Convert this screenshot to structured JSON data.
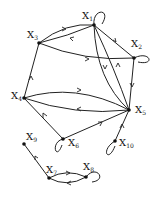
{
  "diagram": {
    "type": "directed-graph",
    "nodes": [
      {
        "id": "x1",
        "label": "X",
        "sub": "1",
        "x": 94,
        "y": 25,
        "lx": 82,
        "ly": 19
      },
      {
        "id": "x2",
        "label": "X",
        "sub": "2",
        "x": 134,
        "y": 58,
        "lx": 131,
        "ly": 47
      },
      {
        "id": "x3",
        "label": "X",
        "sub": "3",
        "x": 39,
        "y": 43,
        "lx": 27,
        "ly": 38
      },
      {
        "id": "x4",
        "label": "X",
        "sub": "4",
        "x": 24,
        "y": 98,
        "lx": 11,
        "ly": 99
      },
      {
        "id": "x5",
        "label": "X",
        "sub": "5",
        "x": 129,
        "y": 110,
        "lx": 135,
        "ly": 113
      },
      {
        "id": "x6",
        "label": "X",
        "sub": "6",
        "x": 63,
        "y": 139,
        "lx": 68,
        "ly": 146
      },
      {
        "id": "x7",
        "label": "X",
        "sub": "7",
        "x": 49,
        "y": 178,
        "lx": 46,
        "ly": 173
      },
      {
        "id": "x8",
        "label": "X",
        "sub": "8",
        "x": 86,
        "y": 177,
        "lx": 83,
        "ly": 170
      },
      {
        "id": "x9",
        "label": "X",
        "sub": "9",
        "x": 24,
        "y": 144,
        "lx": 26,
        "ly": 140
      },
      {
        "id": "x10",
        "label": "X",
        "sub": "10",
        "x": 115,
        "y": 141,
        "lx": 119,
        "ly": 146
      }
    ],
    "edges": [
      {
        "from": "x3",
        "to": "x1",
        "curve": "upper"
      },
      {
        "from": "x1",
        "to": "x3",
        "curve": "lower"
      },
      {
        "from": "x1",
        "to": "x2"
      },
      {
        "from": "x3",
        "to": "x2"
      },
      {
        "from": "x1",
        "to": "x5",
        "curve": "left"
      },
      {
        "from": "x5",
        "to": "x1",
        "curve": "right"
      },
      {
        "from": "x2",
        "to": "x5"
      },
      {
        "from": "x4",
        "to": "x3"
      },
      {
        "from": "x4",
        "to": "x5",
        "curve": "upper"
      },
      {
        "from": "x5",
        "to": "x4",
        "curve": "lower"
      },
      {
        "from": "x6",
        "to": "x4"
      },
      {
        "from": "x6",
        "to": "x5"
      },
      {
        "from": "x10",
        "to": "x5"
      },
      {
        "from": "x7",
        "to": "x9"
      },
      {
        "from": "x7",
        "to": "x8",
        "curve": "upper"
      },
      {
        "from": "x8",
        "to": "x7",
        "curve": "lower"
      }
    ],
    "loops": [
      "x1",
      "x2",
      "x6",
      "x8",
      "x10"
    ],
    "colors": {
      "stroke": "#222222",
      "node": "#111111",
      "background": "#ffffff"
    }
  }
}
